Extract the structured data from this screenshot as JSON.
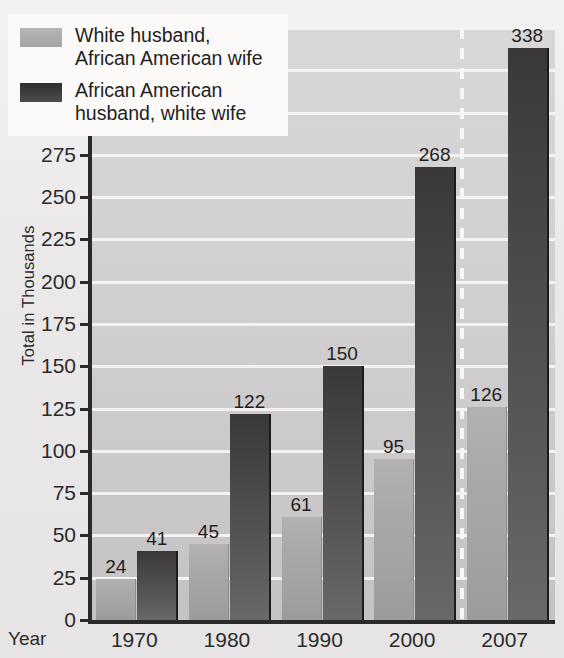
{
  "chart_data": {
    "type": "bar",
    "title": "",
    "xlabel": "Year",
    "ylabel": "Total in Thousands",
    "ylim": [
      0,
      350
    ],
    "ytick_step": 25,
    "yticks": [
      0,
      25,
      50,
      75,
      100,
      125,
      150,
      175,
      200,
      225,
      250,
      275,
      300,
      325,
      350
    ],
    "categories": [
      "1970",
      "1980",
      "1990",
      "2000",
      "2007"
    ],
    "grid": "horizontal",
    "legend_position": "top-left",
    "series": [
      {
        "name": "White husband, African American wife",
        "short_name": "white-husband-african-american-wife",
        "color": "#a9a7a7",
        "values": [
          24,
          45,
          61,
          95,
          126
        ]
      },
      {
        "name": "African American husband, white wife",
        "short_name": "african-american-husband-white-wife",
        "color": "#4a4848",
        "values": [
          41,
          122,
          150,
          268,
          338
        ]
      }
    ],
    "annotations": [
      {
        "name": "dashed-separator",
        "kind": "vertical-dashed-line",
        "between": [
          "2000",
          "2007"
        ],
        "color": "#f8f7f5"
      }
    ]
  },
  "legend": {
    "items": [
      {
        "line1": "White husband,",
        "line2": "African American wife",
        "swatch": "light-gray-swatch"
      },
      {
        "line1": "African American",
        "line2": "husband, white wife",
        "swatch": "dark-gray-swatch"
      }
    ]
  },
  "axes": {
    "x_axis_caption": "Year"
  }
}
